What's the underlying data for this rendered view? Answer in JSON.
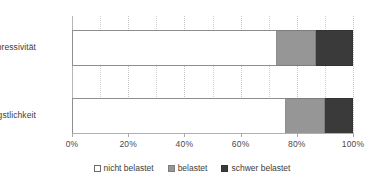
{
  "chart_data": {
    "type": "bar",
    "orientation": "horizontal",
    "stacked": true,
    "normalized_percent": true,
    "title": "",
    "subtitle": "",
    "xlabel": "",
    "ylabel": "",
    "xlim": [
      0,
      100
    ],
    "grid": true,
    "legend_position": "bottom",
    "categories": [
      "Depressivität",
      "Ängstlichkeit"
    ],
    "tick_labels": [
      "0%",
      "20%",
      "40%",
      "60%",
      "80%",
      "100%"
    ],
    "tick_values": [
      0,
      20,
      40,
      60,
      80,
      100
    ],
    "minor_gridline_values": [
      10,
      30,
      50,
      70,
      90
    ],
    "series": [
      {
        "name": "nicht belastet",
        "color": "#ffffff",
        "values": [
          73,
          76
        ]
      },
      {
        "name": "belastet",
        "color": "#969696",
        "values": [
          14,
          14
        ]
      },
      {
        "name": "schwer belastet",
        "color": "#3a3a3a",
        "values": [
          13,
          10
        ]
      }
    ]
  },
  "legend": {
    "items": [
      {
        "label": "nicht belastet"
      },
      {
        "label": "belastet"
      },
      {
        "label": "schwer belastet"
      }
    ]
  }
}
